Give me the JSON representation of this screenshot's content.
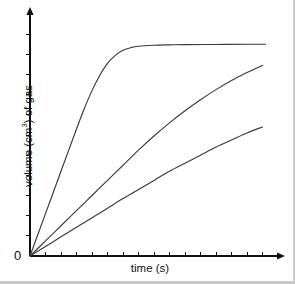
{
  "chart_data": {
    "type": "line",
    "title": "",
    "xlabel": "time (s)",
    "ylabel_prefix": "volume (cm",
    "ylabel_sup": "3",
    "ylabel_suffix": ") of gas",
    "ylabel_plain": "volume (cm3) of gas",
    "origin_label": "0",
    "xlim": [
      0,
      16
    ],
    "ylim": [
      0,
      12
    ],
    "grid": false,
    "legend": "none",
    "x_tick_count": 16,
    "y_tick_count": 12,
    "axis_color": "#111111",
    "curve_color": "#3a3a3a",
    "background_color": "#ffffff",
    "series": [
      {
        "name": "fastest reaction",
        "description": "steep rise then plateau",
        "points": [
          [
            0.0,
            0.0
          ],
          [
            0.5,
            1.05
          ],
          [
            1.0,
            2.1
          ],
          [
            1.5,
            3.15
          ],
          [
            2.0,
            4.2
          ],
          [
            2.5,
            5.25
          ],
          [
            3.0,
            6.3
          ],
          [
            3.5,
            7.3
          ],
          [
            4.0,
            8.2
          ],
          [
            4.5,
            8.95
          ],
          [
            5.0,
            9.55
          ],
          [
            5.5,
            9.95
          ],
          [
            6.0,
            10.2
          ],
          [
            6.5,
            10.33
          ],
          [
            7.0,
            10.4
          ],
          [
            8.0,
            10.45
          ],
          [
            9.0,
            10.47
          ],
          [
            10.0,
            10.48
          ],
          [
            12.0,
            10.49
          ],
          [
            14.0,
            10.5
          ],
          [
            15.2,
            10.5
          ]
        ]
      },
      {
        "name": "medium reaction",
        "description": "gradual curve, still rising at end",
        "points": [
          [
            0.0,
            0.0
          ],
          [
            1.0,
            0.75
          ],
          [
            2.0,
            1.5
          ],
          [
            3.0,
            2.25
          ],
          [
            4.0,
            3.0
          ],
          [
            5.0,
            3.75
          ],
          [
            6.0,
            4.5
          ],
          [
            7.0,
            5.25
          ],
          [
            8.0,
            5.95
          ],
          [
            9.0,
            6.6
          ],
          [
            10.0,
            7.2
          ],
          [
            11.0,
            7.75
          ],
          [
            12.0,
            8.25
          ],
          [
            13.0,
            8.7
          ],
          [
            14.0,
            9.1
          ],
          [
            15.0,
            9.45
          ]
        ]
      },
      {
        "name": "slowest reaction",
        "description": "nearly straight, shallow slope",
        "points": [
          [
            0.0,
            0.0
          ],
          [
            1.0,
            0.47
          ],
          [
            2.0,
            0.95
          ],
          [
            3.0,
            1.42
          ],
          [
            4.0,
            1.9
          ],
          [
            5.0,
            2.37
          ],
          [
            6.0,
            2.85
          ],
          [
            7.0,
            3.3
          ],
          [
            8.0,
            3.75
          ],
          [
            9.0,
            4.2
          ],
          [
            10.0,
            4.6
          ],
          [
            11.0,
            5.0
          ],
          [
            12.0,
            5.4
          ],
          [
            13.0,
            5.75
          ],
          [
            14.0,
            6.1
          ],
          [
            15.0,
            6.4
          ]
        ]
      }
    ]
  }
}
